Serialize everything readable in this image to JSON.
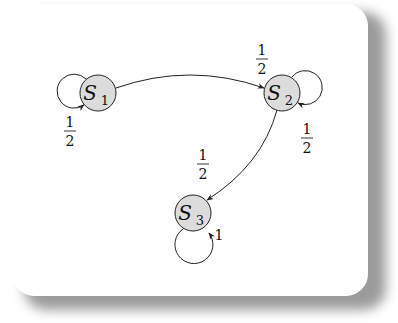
{
  "diagram": {
    "type": "markov-chain-state-diagram",
    "colors": {
      "node_fill": "#dcdcdc",
      "stroke": "#222222",
      "card": "#ffffff",
      "shadow": "#8a8a8a"
    },
    "nodes": [
      {
        "id": "S1",
        "symbol": "S",
        "subscript": "1"
      },
      {
        "id": "S2",
        "symbol": "S",
        "subscript": "2"
      },
      {
        "id": "S3",
        "symbol": "S",
        "subscript": "3"
      }
    ],
    "edges": [
      {
        "from": "S1",
        "to": "S1",
        "num": "1",
        "den": "2"
      },
      {
        "from": "S1",
        "to": "S2",
        "num": "1",
        "den": "2"
      },
      {
        "from": "S2",
        "to": "S2",
        "num": "1",
        "den": "2"
      },
      {
        "from": "S2",
        "to": "S3",
        "num": "1",
        "den": "2"
      },
      {
        "from": "S3",
        "to": "S3",
        "label": "1"
      }
    ]
  }
}
